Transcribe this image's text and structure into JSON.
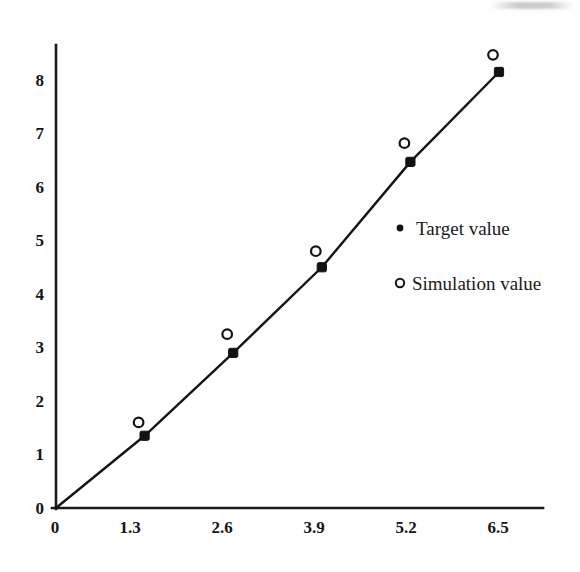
{
  "chart_data": {
    "type": "line",
    "title": "",
    "subtitle": "",
    "xlabel": "",
    "ylabel": "",
    "xlim": [
      0,
      7.06
    ],
    "ylim": [
      0,
      8.7
    ],
    "grid": false,
    "legend_position": "inside-right",
    "x_ticks": [
      "0",
      "1.3",
      "2.6",
      "3.9",
      "5.2",
      "6.5"
    ],
    "x_tick_values": [
      0,
      1.3,
      2.6,
      3.9,
      5.2,
      6.5
    ],
    "y_ticks": [
      "0",
      "1",
      "2",
      "3",
      "4",
      "5",
      "6",
      "7",
      "8"
    ],
    "y_tick_values": [
      0,
      1,
      2,
      3,
      4,
      5,
      6,
      7,
      8
    ],
    "x": [
      0,
      1.3,
      2.6,
      3.9,
      5.2,
      6.5
    ],
    "series": [
      {
        "name": "Target value",
        "marker": "filled-square",
        "has_line": true,
        "values": [
          0,
          1.35,
          2.9,
          4.5,
          6.47,
          8.15
        ]
      },
      {
        "name": "Simulation value",
        "marker": "open-circle",
        "has_line": false,
        "values": [
          null,
          1.6,
          3.25,
          4.8,
          6.82,
          8.47
        ]
      }
    ],
    "annotations": []
  },
  "legend": {
    "entries": [
      {
        "label": "Target value",
        "marker": "filled-dot-icon"
      },
      {
        "label": "Simulation value",
        "marker": "open-circle-icon"
      }
    ]
  },
  "axes": {
    "x_tick_labels": [
      "0",
      "1.3",
      "2.6",
      "3.9",
      "5.2",
      "6.5"
    ],
    "y_tick_labels": [
      "0",
      "1",
      "2",
      "3",
      "4",
      "5",
      "6",
      "7",
      "8"
    ]
  },
  "colors": {
    "ink": "#141414",
    "background": "#fefefe",
    "marker_fill": "#121212",
    "marker_open_fill": "#ffffff"
  }
}
